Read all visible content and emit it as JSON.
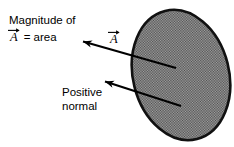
{
  "figure": {
    "type": "vector-area-diagram",
    "background_color": "#ffffff",
    "stroke_color": "#000000",
    "surface_fill_color": "#8f8f8f",
    "labels": {
      "magnitude_line1": "Magnitude of",
      "magnitude_symbol": "A",
      "magnitude_equals": "= area",
      "vector_label": "A",
      "positive_normal_line1": "Positive",
      "positive_normal_line2": "normal"
    },
    "surface": {
      "name": "shaded-ellipse-surface",
      "center_x": 181,
      "center_y": 75,
      "radius_x": 48,
      "radius_y": 66,
      "rotation_deg": -14
    },
    "arrows": [
      {
        "name": "area-vector-arrow",
        "from_x": 176,
        "from_y": 68,
        "to_x": 76,
        "to_y": 39
      },
      {
        "name": "positive-normal-arrow",
        "from_x": 181,
        "from_y": 106,
        "to_x": 98,
        "to_y": 79
      }
    ]
  }
}
